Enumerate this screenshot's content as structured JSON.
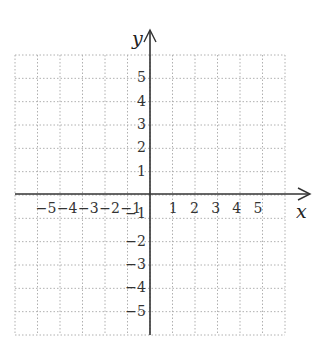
{
  "chart_data": {
    "type": "coordinate-grid",
    "title": "",
    "xlabel": "x",
    "ylabel": "y",
    "xlim": [
      -6,
      6
    ],
    "ylim": [
      -6,
      6
    ],
    "grid": true,
    "grid_style": "dotted",
    "x_ticks": [
      "-5",
      "-4",
      "-3",
      "-2",
      "-1",
      "1",
      "2",
      "3",
      "4",
      "5"
    ],
    "y_ticks": [
      "5",
      "4",
      "3",
      "2",
      "1",
      "-1",
      "-2",
      "-3",
      "-4",
      "-5"
    ],
    "points": []
  },
  "top_fragment": "y",
  "colors": {
    "axis": "#333333",
    "grid": "#b0b0b0",
    "text": "#333333"
  }
}
